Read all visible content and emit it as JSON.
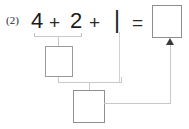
{
  "problem": {
    "number_label": "(2)",
    "equation": {
      "term1": "4",
      "operator1": "+",
      "term2": "2",
      "operator2": "+",
      "term3": "|",
      "equals": "="
    }
  },
  "answer_boxes": {
    "result": {
      "value": "",
      "name": "result-answer-box"
    },
    "step1": {
      "value": "",
      "name": "first-partial-sum-box"
    },
    "step2": {
      "value": "",
      "name": "second-partial-sum-box"
    }
  },
  "connectors": {
    "bracket_4_plus_2": "",
    "bracket_step1_plus_1": "",
    "arrow_to_result": ""
  },
  "colors": {
    "text": "#1a1a1a",
    "problem_number": "#2b2b2b",
    "box_border": "#9a9a9a",
    "connector_line": "#c9c9c9",
    "arrow_head": "#3a3a3a",
    "background": "#ffffff"
  }
}
